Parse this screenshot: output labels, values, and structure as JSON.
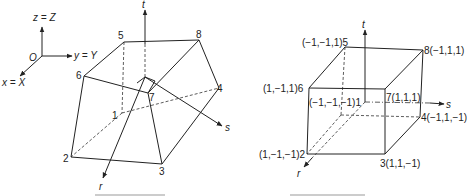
{
  "global_axes": {
    "origin_label": "O",
    "z_label": "z = Z",
    "y_label": "y = Y",
    "x_label": "x = X"
  },
  "left_figure": {
    "description": "Distorted 8-node hexahedral element in global coordinates",
    "axes": {
      "t": "t",
      "s": "s",
      "r": "r"
    },
    "nodes": [
      {
        "id": "1",
        "label": "1"
      },
      {
        "id": "2",
        "label": "2"
      },
      {
        "id": "3",
        "label": "3"
      },
      {
        "id": "4",
        "label": "4"
      },
      {
        "id": "5",
        "label": "5"
      },
      {
        "id": "6",
        "label": "6"
      },
      {
        "id": "7",
        "label": "7"
      },
      {
        "id": "8",
        "label": "8"
      }
    ]
  },
  "right_figure": {
    "description": "Parent cube element in natural coordinates (r, s, t)",
    "axes": {
      "t": "t",
      "s": "s",
      "r": "r"
    },
    "nodes": [
      {
        "id": "1",
        "label": "(−1,−1,−1)1"
      },
      {
        "id": "2",
        "label": "(1,−1,−1)2"
      },
      {
        "id": "3",
        "label": "3(1,1,−1)"
      },
      {
        "id": "4",
        "label": "4(−1,1,−1)"
      },
      {
        "id": "5",
        "label": "(−1,−1,1)5"
      },
      {
        "id": "6",
        "label": "(1,−1,1)6"
      },
      {
        "id": "7",
        "label": "7(1,1,1)"
      },
      {
        "id": "8",
        "label": "8(−1,1,1)"
      }
    ]
  },
  "colors": {
    "line": "#222222",
    "background": "#ffffff"
  }
}
